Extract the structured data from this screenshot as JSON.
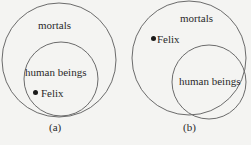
{
  "diagrams": [
    {
      "caption": "(a)",
      "outer_label": "mortals",
      "inner_label": "human beings",
      "point_label": "Felix",
      "point_location": "inside human beings"
    },
    {
      "caption": "(b)",
      "outer_label": "mortals",
      "inner_label": "human beings",
      "point_label": "Felix",
      "point_location": "inside mortals, outside human beings"
    }
  ],
  "colors": {
    "stroke": "#6b6b6b",
    "background": "#f4f4f2",
    "text": "#2a2a2a"
  }
}
